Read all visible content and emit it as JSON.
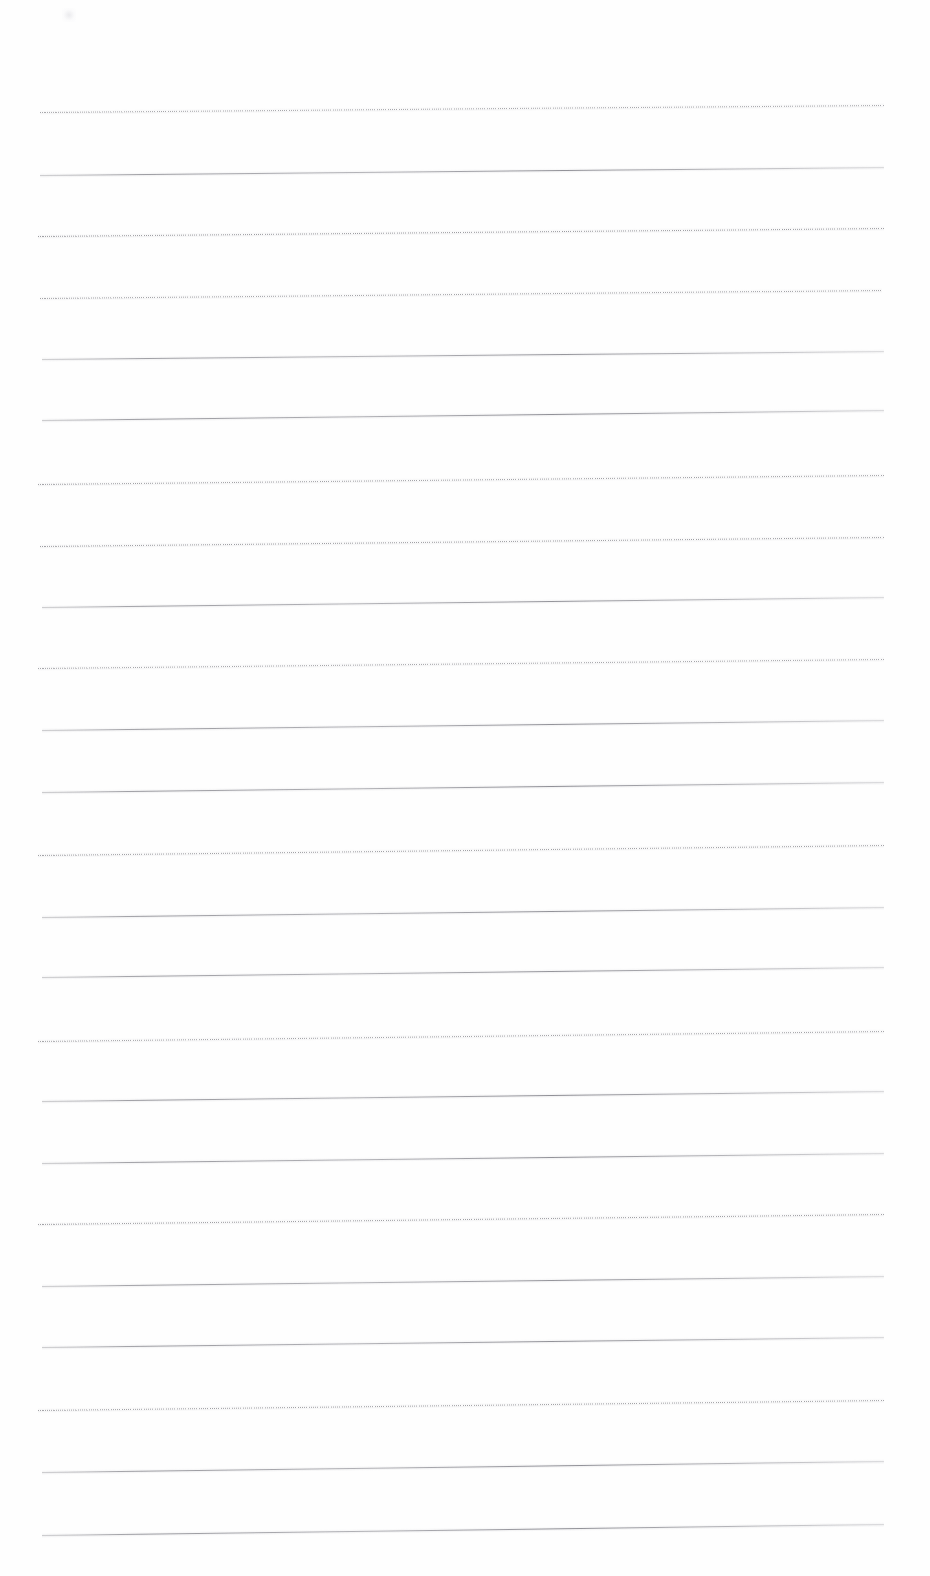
{
  "document": {
    "kind": "scanned-blank-lined-page",
    "page_width": 930,
    "page_height": 1576,
    "background_color": "#fefefe",
    "visible_text": "",
    "body_text": "",
    "header_text": "",
    "footer_text": "",
    "page_number": ""
  },
  "ruling": {
    "line_color": "#6e6e76",
    "line_color_light": "#9a9aa2",
    "line_count": 24,
    "first_line_y": 112,
    "line_spacing": 61.8,
    "left_x": 40,
    "right_x": 884,
    "thickness_px": 1,
    "margin_rule": "none",
    "lines": [
      {
        "index": 1,
        "y_left": 112,
        "y_right": 105,
        "style": "dotted",
        "left_x": 40,
        "right_x": 884,
        "opacity": 0.7
      },
      {
        "index": 2,
        "y_left": 175,
        "y_right": 167,
        "style": "solid",
        "left_x": 40,
        "right_x": 884,
        "opacity": 0.85
      },
      {
        "index": 3,
        "y_left": 236,
        "y_right": 228,
        "style": "dotted",
        "left_x": 38,
        "right_x": 884,
        "opacity": 0.78
      },
      {
        "index": 4,
        "y_left": 298,
        "y_right": 290,
        "style": "dotted",
        "left_x": 40,
        "right_x": 882,
        "opacity": 0.72
      },
      {
        "index": 5,
        "y_left": 359,
        "y_right": 351,
        "style": "solid",
        "left_x": 42,
        "right_x": 884,
        "opacity": 0.82
      },
      {
        "index": 6,
        "y_left": 420,
        "y_right": 410,
        "style": "solid",
        "left_x": 42,
        "right_x": 884,
        "opacity": 0.88
      },
      {
        "index": 7,
        "y_left": 484,
        "y_right": 475,
        "style": "dotted",
        "left_x": 38,
        "right_x": 884,
        "opacity": 0.74
      },
      {
        "index": 8,
        "y_left": 546,
        "y_right": 537,
        "style": "dotted",
        "left_x": 40,
        "right_x": 884,
        "opacity": 0.76
      },
      {
        "index": 9,
        "y_left": 607,
        "y_right": 597,
        "style": "solid",
        "left_x": 42,
        "right_x": 884,
        "opacity": 0.84
      },
      {
        "index": 10,
        "y_left": 668,
        "y_right": 659,
        "style": "dotted",
        "left_x": 38,
        "right_x": 884,
        "opacity": 0.7
      },
      {
        "index": 11,
        "y_left": 730,
        "y_right": 720,
        "style": "solid",
        "left_x": 42,
        "right_x": 884,
        "opacity": 0.86
      },
      {
        "index": 12,
        "y_left": 792,
        "y_right": 782,
        "style": "solid",
        "left_x": 42,
        "right_x": 884,
        "opacity": 0.88
      },
      {
        "index": 13,
        "y_left": 855,
        "y_right": 845,
        "style": "dotted",
        "left_x": 38,
        "right_x": 884,
        "opacity": 0.74
      },
      {
        "index": 14,
        "y_left": 917,
        "y_right": 907,
        "style": "solid",
        "left_x": 42,
        "right_x": 884,
        "opacity": 0.86
      },
      {
        "index": 15,
        "y_left": 977,
        "y_right": 967,
        "style": "solid",
        "left_x": 42,
        "right_x": 884,
        "opacity": 0.84
      },
      {
        "index": 16,
        "y_left": 1041,
        "y_right": 1031,
        "style": "dotted",
        "left_x": 38,
        "right_x": 884,
        "opacity": 0.72
      },
      {
        "index": 17,
        "y_left": 1101,
        "y_right": 1091,
        "style": "solid",
        "left_x": 42,
        "right_x": 884,
        "opacity": 0.88
      },
      {
        "index": 18,
        "y_left": 1163,
        "y_right": 1153,
        "style": "solid",
        "left_x": 42,
        "right_x": 884,
        "opacity": 0.86
      },
      {
        "index": 19,
        "y_left": 1224,
        "y_right": 1214,
        "style": "dotted",
        "left_x": 38,
        "right_x": 884,
        "opacity": 0.76
      },
      {
        "index": 20,
        "y_left": 1286,
        "y_right": 1276,
        "style": "solid",
        "left_x": 42,
        "right_x": 884,
        "opacity": 0.84
      },
      {
        "index": 21,
        "y_left": 1347,
        "y_right": 1337,
        "style": "solid",
        "left_x": 42,
        "right_x": 884,
        "opacity": 0.86
      },
      {
        "index": 22,
        "y_left": 1410,
        "y_right": 1400,
        "style": "dotted",
        "left_x": 38,
        "right_x": 884,
        "opacity": 0.74
      },
      {
        "index": 23,
        "y_left": 1472,
        "y_right": 1461,
        "style": "solid",
        "left_x": 42,
        "right_x": 884,
        "opacity": 0.88
      },
      {
        "index": 24,
        "y_left": 1535,
        "y_right": 1524,
        "style": "solid",
        "left_x": 42,
        "right_x": 884,
        "opacity": 0.88
      }
    ]
  },
  "artifacts": {
    "smudge": {
      "x": 62,
      "y": 8,
      "width": 14,
      "height": 14,
      "label": "scan-smudge"
    }
  }
}
